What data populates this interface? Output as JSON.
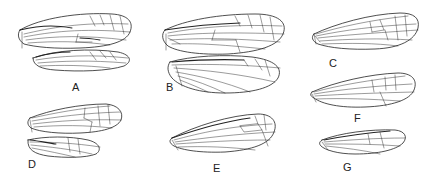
{
  "figure": {
    "panels": [
      {
        "id": "A",
        "label": "A",
        "wings": [
          "forewing",
          "hindwing"
        ]
      },
      {
        "id": "B",
        "label": "B",
        "wings": [
          "forewing",
          "hindwing"
        ]
      },
      {
        "id": "C",
        "label": "C",
        "wings": [
          "forewing"
        ]
      },
      {
        "id": "D",
        "label": "D",
        "wings": [
          "forewing",
          "hindwing"
        ]
      },
      {
        "id": "E",
        "label": "E",
        "wings": [
          "forewing"
        ]
      },
      {
        "id": "F",
        "label": "F",
        "wings": [
          "forewing"
        ]
      },
      {
        "id": "G",
        "label": "G",
        "wings": [
          "forewing"
        ]
      }
    ],
    "colors": {
      "ink": "#222222",
      "background": "#ffffff"
    }
  }
}
